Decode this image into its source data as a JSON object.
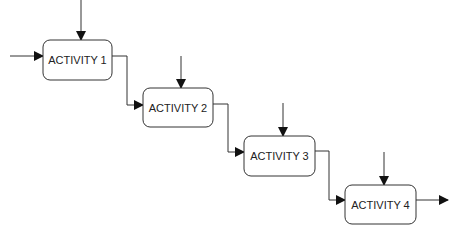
{
  "diagram": {
    "type": "waterfall-process-flow",
    "colors": {
      "stroke": "#333333",
      "box_fill": "#ffffff",
      "text": "#222222",
      "background": "#ffffff"
    },
    "activities": [
      {
        "label": "ACTIVITY 1"
      },
      {
        "label": "ACTIVITY 2"
      },
      {
        "label": "ACTIVITY 3"
      },
      {
        "label": "ACTIVITY 4"
      }
    ]
  }
}
